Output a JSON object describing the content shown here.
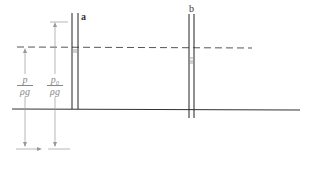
{
  "diagram": {
    "tube_a_label": "a",
    "tube_b_label": "b",
    "fraction_left": {
      "numerator": "p",
      "denominator": "ρg"
    },
    "fraction_right": {
      "numerator": "p₀",
      "denominator": "ρg"
    },
    "colors": {
      "line": "#333333",
      "dim": "#999999"
    }
  }
}
